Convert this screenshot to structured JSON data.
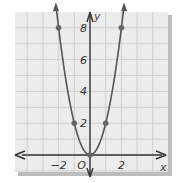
{
  "chart_data": {
    "type": "line",
    "title": "",
    "xlabel": "x",
    "ylabel": "y",
    "origin_label": "O",
    "xlim": [
      -4.7,
      5.1
    ],
    "ylim": [
      -1.2,
      9.4
    ],
    "grid": true,
    "x_ticks": [
      {
        "value": -2,
        "label": "−2"
      },
      {
        "value": 2,
        "label": "2"
      }
    ],
    "y_ticks": [
      {
        "value": 2,
        "label": "2"
      },
      {
        "value": 4,
        "label": "4"
      },
      {
        "value": 6,
        "label": "6"
      },
      {
        "value": 8,
        "label": "8"
      }
    ],
    "series": [
      {
        "name": "y = 2x²",
        "function": "2*x^2",
        "curve_x_range": [
          -2.17,
          2.17
        ],
        "points": [
          {
            "x": -2,
            "y": 8
          },
          {
            "x": -1,
            "y": 2
          },
          {
            "x": 0,
            "y": 0
          },
          {
            "x": 1,
            "y": 2
          },
          {
            "x": 2,
            "y": 8
          }
        ]
      }
    ],
    "colors": {
      "curve": "#555555",
      "points": "#666666",
      "grid": "#cfcfcf",
      "background": "#ececec",
      "shadow": "#bdbdbd",
      "axis": "#333333"
    }
  }
}
